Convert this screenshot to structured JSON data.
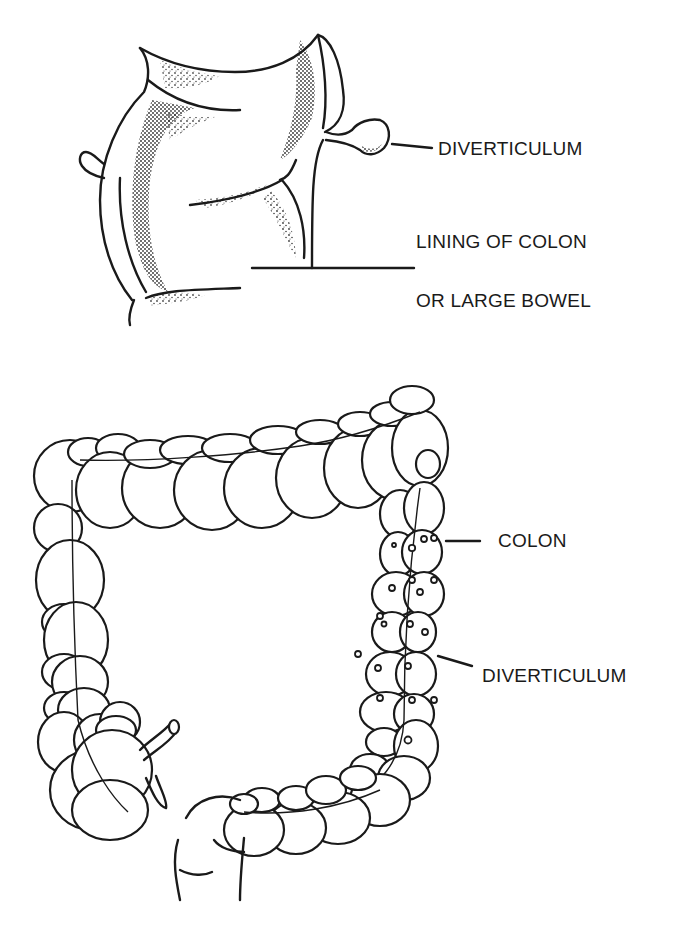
{
  "figure": {
    "top_illustration": {
      "name": "colon-wall-cross-section",
      "labels": {
        "diverticulum": "DIVERTICULUM",
        "lining_line1": "LINING OF COLON",
        "lining_line2": "OR LARGE BOWEL"
      }
    },
    "bottom_illustration": {
      "name": "large-intestine-overview",
      "labels": {
        "colon": "COLON",
        "diverticulum": "DIVERTICULUM"
      }
    },
    "colors": {
      "ink": "#1a1a1a",
      "background": "#ffffff"
    }
  }
}
